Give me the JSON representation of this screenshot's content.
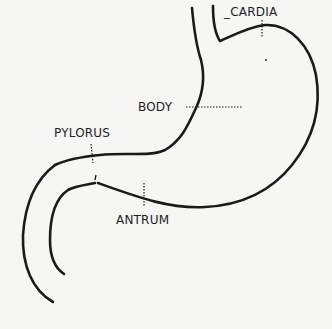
{
  "diagram": {
    "labels": {
      "cardia": "_CARDIA",
      "body": "BODY",
      "pylorus": "PYLORUS",
      "antrum": "ANTRUM"
    },
    "colors": {
      "background": "#f6f6f4",
      "stroke": "#1a1a1a"
    }
  }
}
